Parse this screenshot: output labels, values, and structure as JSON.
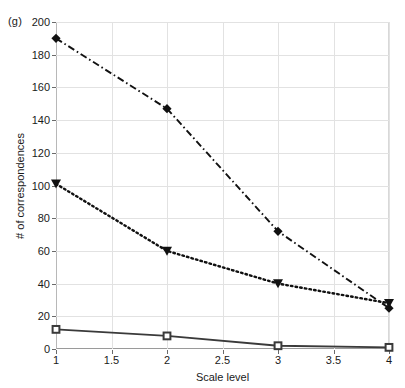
{
  "panel": {
    "label": "(g)"
  },
  "chart_data": {
    "type": "line",
    "title": "",
    "xlabel": "Scale level",
    "ylabel": "# of correspondences",
    "xlim": [
      1,
      4
    ],
    "ylim": [
      0,
      200
    ],
    "xticks": [
      "1",
      "1.5",
      "2",
      "2.5",
      "3",
      "3.5",
      "4"
    ],
    "xtick_values": [
      1,
      1.5,
      2,
      2.5,
      3,
      3.5,
      4
    ],
    "yticks": [
      "0",
      "20",
      "40",
      "60",
      "80",
      "100",
      "120",
      "140",
      "160",
      "180",
      "200"
    ],
    "ytick_values": [
      0,
      20,
      40,
      60,
      80,
      100,
      120,
      140,
      160,
      180,
      200
    ],
    "grid": true,
    "legend": "none",
    "x": [
      1,
      2,
      3,
      4
    ],
    "series": [
      {
        "name": "series-diamond",
        "marker": "diamond",
        "linestyle": "dashdot",
        "color": "#111111",
        "values": [
          190,
          147,
          72,
          25
        ]
      },
      {
        "name": "series-triangle-down",
        "marker": "triangle-down",
        "linestyle": "dotted",
        "color": "#111111",
        "values": [
          101,
          60,
          40,
          28
        ]
      },
      {
        "name": "series-square",
        "marker": "square",
        "linestyle": "solid",
        "color": "#3a3a3a",
        "values": [
          12,
          8,
          2,
          1
        ]
      }
    ]
  }
}
